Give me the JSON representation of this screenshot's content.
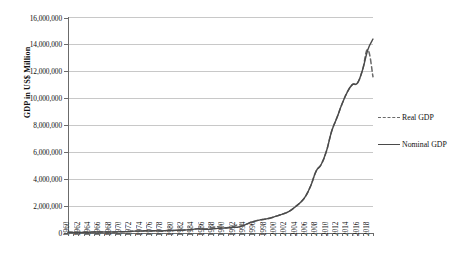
{
  "chart_data": {
    "type": "line",
    "title": "",
    "xlabel": "",
    "ylabel": "GDP in US$ Million",
    "ylim": [
      0,
      16000000
    ],
    "xlim": [
      1960,
      2019
    ],
    "grid": true,
    "legend_position": "right",
    "y_ticks": [
      "0",
      "2,000,000",
      "4,000,000",
      "6,000,000",
      "8,000,000",
      "10,000,000",
      "12,000,000",
      "14,000,000",
      "16,000,000"
    ],
    "y_tick_values": [
      0,
      2000000,
      4000000,
      6000000,
      8000000,
      10000000,
      12000000,
      14000000,
      16000000
    ],
    "x_tick_labels": [
      "1960",
      "1962",
      "1964",
      "1966",
      "1968",
      "1970",
      "1972",
      "1974",
      "1976",
      "1978",
      "1980",
      "1982",
      "1984",
      "1986",
      "1988",
      "1990",
      "1992",
      "1994",
      "1996",
      "1998",
      "2000",
      "2002",
      "2004",
      "2006",
      "2008",
      "2010",
      "2012",
      "2014",
      "2016",
      "2018"
    ],
    "x": [
      1960,
      1961,
      1962,
      1963,
      1964,
      1965,
      1966,
      1967,
      1968,
      1969,
      1970,
      1971,
      1972,
      1973,
      1974,
      1975,
      1976,
      1977,
      1978,
      1979,
      1980,
      1981,
      1982,
      1983,
      1984,
      1985,
      1986,
      1987,
      1988,
      1989,
      1990,
      1991,
      1992,
      1993,
      1994,
      1995,
      1996,
      1997,
      1998,
      1999,
      2000,
      2001,
      2002,
      2003,
      2004,
      2005,
      2006,
      2007,
      2008,
      2009,
      2010,
      2011,
      2012,
      2013,
      2014,
      2015,
      2016,
      2017,
      2018,
      2019
    ],
    "series": [
      {
        "name": "Real GDP",
        "style": "dashed",
        "color": "#6a6a6a",
        "values": [
          59700,
          50100,
          47200,
          50700,
          59700,
          70400,
          76700,
          72900,
          70800,
          78700,
          92600,
          99800,
          113700,
          138500,
          144200,
          163400,
          151600,
          172300,
          149500,
          178300,
          191100,
          195900,
          205100,
          230700,
          259600,
          309500,
          300800,
          327000,
          408000,
          459000,
          398000,
          413000,
          493000,
          619000,
          564000,
          734000,
          863000,
          961000,
          1029000,
          1094000,
          1211000,
          1339000,
          1470000,
          1660000,
          1955000,
          2286000,
          2752000,
          3550000,
          4594000,
          5102000,
          6087000,
          7552000,
          8532000,
          9570000,
          10438000,
          11016000,
          11138000,
          12143000,
          13608000,
          11600000
        ]
      },
      {
        "name": "Nominal GDP",
        "style": "solid",
        "color": "#4a4a4a",
        "values": [
          59700,
          50100,
          47200,
          50700,
          59700,
          70400,
          76700,
          72900,
          70800,
          78700,
          92600,
          99800,
          113700,
          138500,
          144200,
          163400,
          151600,
          172300,
          149500,
          178300,
          191100,
          195900,
          205100,
          230700,
          259600,
          309500,
          297000,
          270000,
          309000,
          343000,
          360000,
          383000,
          426000,
          444000,
          564000,
          734000,
          863000,
          961000,
          1029000,
          1094000,
          1211000,
          1339000,
          1470000,
          1660000,
          1955000,
          2286000,
          2752000,
          3550000,
          4594000,
          5102000,
          6087000,
          7552000,
          8532000,
          9570000,
          10438000,
          11016000,
          11138000,
          12143000,
          13608000,
          14400000
        ]
      }
    ]
  },
  "legend": {
    "items": [
      {
        "label": "Real GDP",
        "style": "dashed"
      },
      {
        "label": "Nominal GDP",
        "style": "solid"
      }
    ]
  },
  "axis": {
    "y_title": "GDP in US$ Million"
  }
}
